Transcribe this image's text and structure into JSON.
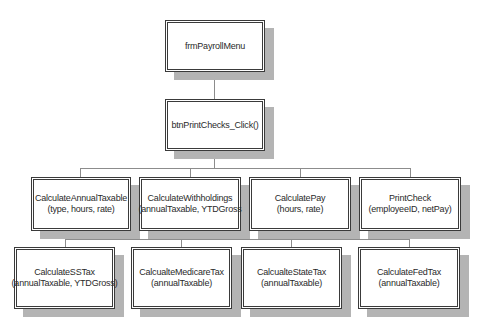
{
  "diagram": {
    "type": "hierarchy-chart",
    "root": {
      "name": "frmPayrollMenu",
      "params": ""
    },
    "level2": {
      "name": "btnPrintChecks_Click()",
      "params": ""
    },
    "level3": [
      {
        "name": "CalculateAnnualTaxable",
        "params": "(type, hours, rate)"
      },
      {
        "name": "CalculateWithholdings",
        "params": "(annualTaxable, YTDGross"
      },
      {
        "name": "CalculatePay",
        "params": "(hours, rate)"
      },
      {
        "name": "PrintCheck",
        "params": "(employeeID, netPay)"
      }
    ],
    "level4_parent": "CalculateWithholdings",
    "level4": [
      {
        "name": "CalculateSSTax",
        "params": "(annualTaxable, YTDGross)"
      },
      {
        "name": "CalcualteMedicareTax",
        "params": "(annualTaxable)"
      },
      {
        "name": "CalcualteStateTax",
        "params": "(annualTaxable)"
      },
      {
        "name": "CalculateFedTax",
        "params": "(annualTaxable)"
      }
    ],
    "colors": {
      "border": "#3a3a3a",
      "shadow": "#b4b4b4",
      "connector": "#8c8c8c"
    }
  }
}
